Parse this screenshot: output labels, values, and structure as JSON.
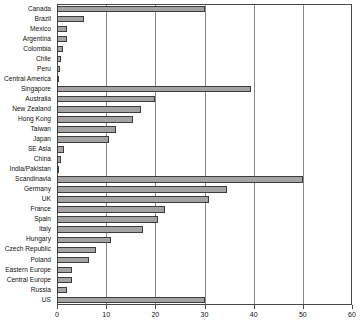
{
  "chart_data": {
    "type": "bar",
    "orientation": "horizontal",
    "title": "",
    "subtitle": "",
    "xlabel": "",
    "ylabel": "",
    "xlim": [
      0,
      60
    ],
    "ylim": null,
    "grid": true,
    "grid_axis": "x",
    "legend": false,
    "legend_position": "none",
    "bar_color": "#a3a3a3",
    "bar_edge_color": "#3d3d3d",
    "frame_color": "#4a4a4a",
    "gridline_color": "#8a8a8a",
    "xticks": [
      0,
      10,
      20,
      30,
      40,
      50,
      60
    ],
    "xticklabels": [
      "0",
      "10",
      "20",
      "30",
      "40",
      "50",
      "60"
    ],
    "categories": [
      "Canada",
      "Brazil",
      "Mexico",
      "Argentina",
      "Colombia",
      "Chile",
      "Peru",
      "Central America",
      "Singapore",
      "Australia",
      "New Zealand",
      "Hong Kong",
      "Taiwan",
      "Japan",
      "SE Asia",
      "China",
      "India/Pakistan",
      "Scandinavia",
      "Germany",
      "UK",
      "France",
      "Spain",
      "Italy",
      "Hungary",
      "Czech Republic",
      "Poland",
      "Eastern Europe",
      "Central Europe",
      "Russia",
      "US"
    ],
    "values": [
      30.0,
      5.5,
      2.0,
      2.0,
      1.2,
      0.8,
      0.7,
      0.5,
      39.5,
      20.0,
      17.0,
      15.5,
      12.0,
      10.5,
      1.5,
      0.8,
      0.4,
      50.0,
      34.5,
      31.0,
      22.0,
      20.5,
      17.5,
      11.0,
      8.0,
      6.5,
      3.0,
      3.0,
      2.0,
      30.0
    ]
  }
}
